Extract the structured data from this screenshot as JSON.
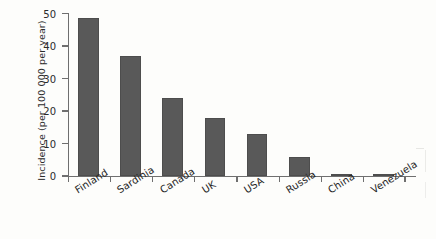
{
  "chart_data": {
    "type": "bar",
    "title": "",
    "xlabel": "",
    "ylabel": "Incidence (per 100 000 per year)",
    "categories": [
      "Finland",
      "Sardinia",
      "Canada",
      "UK",
      "USA",
      "Russia",
      "China",
      "Venezuela"
    ],
    "values": [
      48.5,
      37.0,
      24.0,
      17.8,
      12.8,
      5.9,
      0.5,
      0.2
    ],
    "ylim": [
      0,
      50
    ],
    "yticks": [
      0,
      10,
      20,
      30,
      40,
      50
    ],
    "ytick_labels": [
      "0",
      "10",
      "20",
      "30",
      "40",
      "50"
    ],
    "grid": false,
    "legend": false,
    "legend_position": "none",
    "series": [
      {
        "name": "Incidence",
        "values": [
          48.5,
          37.0,
          24.0,
          17.8,
          12.8,
          5.9,
          0.5,
          0.2
        ]
      }
    ],
    "bar_color": "#595959",
    "axis_color": "#6f6f6f",
    "background_color": "#fdfdfb",
    "xtick_label_rotation": -32
  }
}
